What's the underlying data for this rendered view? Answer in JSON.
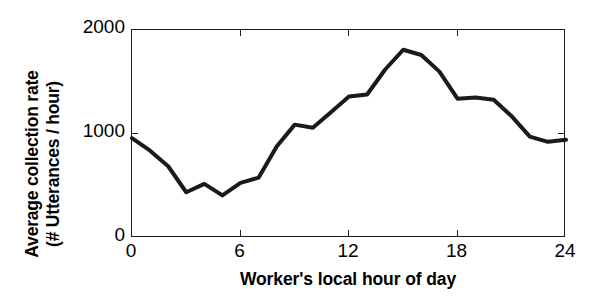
{
  "chart_data": {
    "type": "line",
    "title": "",
    "xlabel": "Worker's local hour of day",
    "ylabel": "Average collection rate (# Utterances / hour)",
    "ylabel_line1": "Average collection rate",
    "ylabel_line2": "(# Utterances / hour)",
    "xlim": [
      0,
      24
    ],
    "ylim": [
      0,
      2000
    ],
    "xticks": [
      0,
      6,
      12,
      18,
      24
    ],
    "xtick_labels": [
      "0",
      "6",
      "12",
      "18",
      "24"
    ],
    "yticks": [
      0,
      1000,
      2000
    ],
    "ytick_labels": [
      "0",
      "1000",
      "2000"
    ],
    "grid": false,
    "legend": null,
    "line_color": "#1a1a1a",
    "line_width": 4,
    "x": [
      0,
      1,
      2,
      3,
      4,
      5,
      6,
      7,
      8,
      9,
      10,
      11,
      12,
      13,
      14,
      15,
      16,
      17,
      18,
      19,
      20,
      21,
      22,
      23,
      24
    ],
    "values": [
      960,
      840,
      690,
      440,
      520,
      410,
      530,
      580,
      880,
      1090,
      1060,
      1210,
      1360,
      1380,
      1620,
      1810,
      1760,
      1600,
      1340,
      1350,
      1330,
      1170,
      975,
      925,
      945
    ],
    "series": [
      {
        "name": "Average collection rate",
        "values": [
          960,
          840,
          690,
          440,
          520,
          410,
          530,
          580,
          880,
          1090,
          1060,
          1210,
          1360,
          1380,
          1620,
          1810,
          1760,
          1600,
          1340,
          1350,
          1330,
          1170,
          975,
          925,
          945
        ]
      }
    ]
  }
}
